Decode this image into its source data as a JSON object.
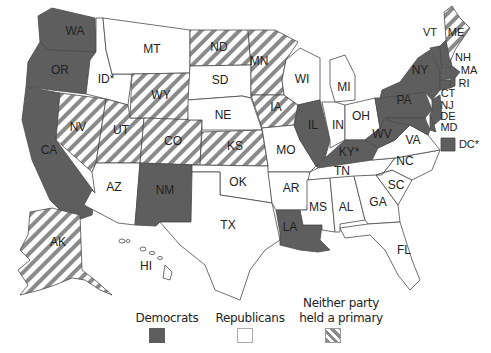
{
  "legend": {
    "democrats": "Democrats",
    "republicans": "Republicans",
    "neither_line1": "Neither party",
    "neither_line2": "held a primary"
  },
  "colors": {
    "democrats": "#5e5e5e",
    "republicans": "#ffffff",
    "neither_stripe": "#8a8a8a",
    "border": "#4a4a4a"
  },
  "states": {
    "WA": {
      "label": "WA",
      "category": "democrats"
    },
    "OR": {
      "label": "OR",
      "category": "democrats"
    },
    "CA": {
      "label": "CA",
      "category": "democrats"
    },
    "ID": {
      "label": "ID*",
      "category": "republicans"
    },
    "MT": {
      "label": "MT",
      "category": "republicans"
    },
    "NV": {
      "label": "NV",
      "category": "neither"
    },
    "UT": {
      "label": "UT",
      "category": "neither"
    },
    "WY": {
      "label": "WY",
      "category": "neither"
    },
    "CO": {
      "label": "CO",
      "category": "neither"
    },
    "AZ": {
      "label": "AZ",
      "category": "republicans"
    },
    "NM": {
      "label": "NM",
      "category": "democrats"
    },
    "ND": {
      "label": "ND",
      "category": "neither"
    },
    "SD": {
      "label": "SD",
      "category": "republicans"
    },
    "NE": {
      "label": "NE",
      "category": "republicans"
    },
    "KS": {
      "label": "KS",
      "category": "neither"
    },
    "OK": {
      "label": "OK",
      "category": "republicans"
    },
    "TX": {
      "label": "TX",
      "category": "republicans"
    },
    "MN": {
      "label": "MN",
      "category": "neither"
    },
    "IA": {
      "label": "IA",
      "category": "neither"
    },
    "MO": {
      "label": "MO",
      "category": "republicans"
    },
    "AR": {
      "label": "AR",
      "category": "republicans"
    },
    "LA": {
      "label": "LA",
      "category": "democrats"
    },
    "WI": {
      "label": "WI",
      "category": "republicans"
    },
    "IL": {
      "label": "IL",
      "category": "democrats"
    },
    "MI": {
      "label": "MI",
      "category": "republicans"
    },
    "IN": {
      "label": "IN",
      "category": "republicans"
    },
    "OH": {
      "label": "OH",
      "category": "republicans"
    },
    "KY": {
      "label": "KY*",
      "category": "democrats"
    },
    "TN": {
      "label": "TN",
      "category": "republicans"
    },
    "MS": {
      "label": "MS",
      "category": "republicans"
    },
    "AL": {
      "label": "AL",
      "category": "republicans"
    },
    "GA": {
      "label": "GA",
      "category": "republicans"
    },
    "FL": {
      "label": "FL",
      "category": "republicans"
    },
    "SC": {
      "label": "SC",
      "category": "republicans"
    },
    "NC": {
      "label": "NC",
      "category": "republicans"
    },
    "VA": {
      "label": "VA",
      "category": "republicans"
    },
    "WV": {
      "label": "WV",
      "category": "democrats"
    },
    "PA": {
      "label": "PA",
      "category": "democrats"
    },
    "NY": {
      "label": "NY",
      "category": "democrats"
    },
    "VT": {
      "label": "VT",
      "category": "democrats"
    },
    "NH": {
      "label": "NH",
      "category": "democrats"
    },
    "ME": {
      "label": "ME",
      "category": "neither"
    },
    "MA": {
      "label": "MA",
      "category": "democrats"
    },
    "RI": {
      "label": "RI",
      "category": "democrats"
    },
    "CT": {
      "label": "CT",
      "category": "democrats"
    },
    "NJ": {
      "label": "NJ",
      "category": "democrats"
    },
    "DE": {
      "label": "DE",
      "category": "democrats"
    },
    "MD": {
      "label": "MD",
      "category": "democrats"
    },
    "DC": {
      "label": "DC*",
      "category": "democrats"
    },
    "AK": {
      "label": "AK",
      "category": "neither"
    },
    "HI": {
      "label": "HI",
      "category": "republicans"
    }
  }
}
